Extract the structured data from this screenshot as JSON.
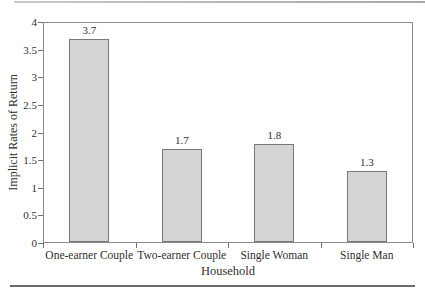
{
  "chart_data": {
    "type": "bar",
    "categories": [
      "One-earner Couple",
      "Two-earner Couple",
      "Single Woman",
      "Single Man"
    ],
    "values": [
      3.7,
      1.7,
      1.8,
      1.3
    ],
    "value_labels": [
      "3.7",
      "1.7",
      "1.8",
      "1.3"
    ],
    "title": "",
    "xlabel": "Household",
    "ylabel": "Implicit Rates of Return",
    "ylim": [
      0,
      4
    ],
    "ytick_step": 0.5,
    "ytick_labels": [
      "0",
      "0.5",
      "1",
      "1.5",
      "2",
      "2.5",
      "3",
      "3.5",
      "4"
    ],
    "grid": false,
    "legend": null,
    "colors": {
      "bar_fill": "#d4d4d4",
      "bar_border": "#787878",
      "axis_frame": "#8a8a8a",
      "text": "#2f2f2f",
      "top_rule": "#b0b0b0",
      "bottom_rule": "#6a6a6a"
    }
  }
}
